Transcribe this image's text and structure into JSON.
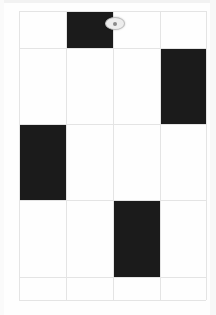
{
  "page": {
    "width": 216,
    "height": 315,
    "background_color": "#ffffff"
  },
  "grid": {
    "name": "pattern-grid",
    "columns": 4,
    "rows": 5,
    "left": 19,
    "top": 11,
    "right": 206,
    "bottom": 300,
    "column_edges": [
      19,
      66,
      113,
      160,
      206
    ],
    "row_edges": [
      11,
      48,
      124,
      200,
      277,
      300
    ],
    "line_color": "#e4e4e4",
    "line_width": 1,
    "fill_color": "#1b1b1b",
    "empty_color": "#ffffff",
    "cells": [
      {
        "id": "r1c1",
        "row": 1,
        "col": 1,
        "state": "empty",
        "label": ""
      },
      {
        "id": "r1c2",
        "row": 1,
        "col": 2,
        "state": "filled",
        "label": ""
      },
      {
        "id": "r1c3",
        "row": 1,
        "col": 3,
        "state": "empty",
        "label": ""
      },
      {
        "id": "r1c4",
        "row": 1,
        "col": 4,
        "state": "empty",
        "label": ""
      },
      {
        "id": "r2c1",
        "row": 2,
        "col": 1,
        "state": "empty",
        "label": ""
      },
      {
        "id": "r2c2",
        "row": 2,
        "col": 2,
        "state": "empty",
        "label": ""
      },
      {
        "id": "r2c3",
        "row": 2,
        "col": 3,
        "state": "empty",
        "label": ""
      },
      {
        "id": "r2c4",
        "row": 2,
        "col": 4,
        "state": "filled",
        "label": ""
      },
      {
        "id": "r3c1",
        "row": 3,
        "col": 1,
        "state": "filled",
        "label": ""
      },
      {
        "id": "r3c2",
        "row": 3,
        "col": 2,
        "state": "empty",
        "label": ""
      },
      {
        "id": "r3c3",
        "row": 3,
        "col": 3,
        "state": "empty",
        "label": ""
      },
      {
        "id": "r3c4",
        "row": 3,
        "col": 4,
        "state": "empty",
        "label": ""
      },
      {
        "id": "r4c1",
        "row": 4,
        "col": 1,
        "state": "empty",
        "label": ""
      },
      {
        "id": "r4c2",
        "row": 4,
        "col": 2,
        "state": "empty",
        "label": ""
      },
      {
        "id": "r4c3",
        "row": 4,
        "col": 3,
        "state": "filled",
        "label": ""
      },
      {
        "id": "r4c4",
        "row": 4,
        "col": 4,
        "state": "empty",
        "label": ""
      },
      {
        "id": "r5c1",
        "row": 5,
        "col": 1,
        "state": "empty",
        "label": ""
      },
      {
        "id": "r5c2",
        "row": 5,
        "col": 2,
        "state": "empty",
        "label": ""
      },
      {
        "id": "r5c3",
        "row": 5,
        "col": 3,
        "state": "empty",
        "label": ""
      },
      {
        "id": "r5c4",
        "row": 5,
        "col": 4,
        "state": "empty",
        "label": ""
      }
    ]
  },
  "cursor": {
    "name": "cursor-oval",
    "left": 105,
    "top": 17,
    "width": 18,
    "height": 11,
    "fill_color": "#ededed",
    "border_color": "#bdbdbd",
    "label": ""
  }
}
